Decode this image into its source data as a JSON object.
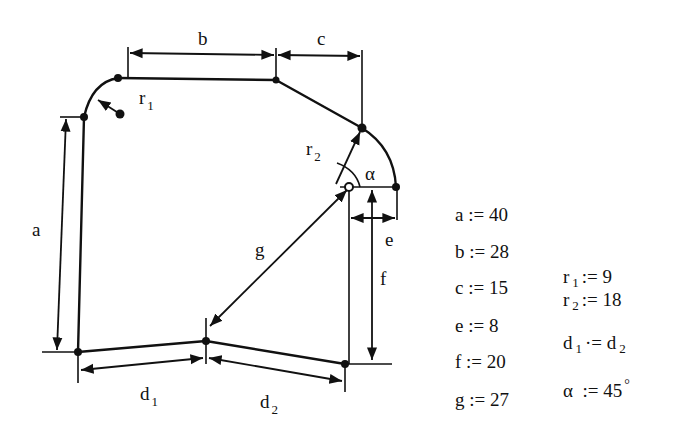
{
  "diagram": {
    "labels": {
      "a": "a",
      "b": "b",
      "c": "c",
      "e": "e",
      "f": "f",
      "g": "g",
      "r1": "r",
      "r1_sub": "1",
      "r2": "r",
      "r2_sub": "2",
      "alpha": "α",
      "d1": "d",
      "d1_sub": "1",
      "d2": "d",
      "d2_sub": "2"
    },
    "stroke_color": "#111111",
    "background": "#ffffff"
  },
  "variables": {
    "left": [
      {
        "name": "a",
        "op": ":=",
        "value": "40"
      },
      {
        "name": "b",
        "op": ":=",
        "value": "28"
      },
      {
        "name": "c",
        "op": ":=",
        "value": "15"
      },
      {
        "name": "e",
        "op": ":=",
        "value": "8"
      },
      {
        "name": "f",
        "op": ":=",
        "value": "20"
      },
      {
        "name": "g",
        "op": ":=",
        "value": "27"
      }
    ],
    "right": {
      "r1": {
        "name": "r",
        "sub": "1",
        "op": ":=",
        "value": "9"
      },
      "r2": {
        "name": "r",
        "sub": "2",
        "op": ":=",
        "value": "18"
      },
      "d": {
        "lhs": "d",
        "lhs_sub": "1",
        "op": "·=",
        "rhs": "d",
        "rhs_sub": "2"
      },
      "alpha": {
        "name": "α",
        "op": ":=",
        "value": "45",
        "unit": "°"
      }
    }
  }
}
